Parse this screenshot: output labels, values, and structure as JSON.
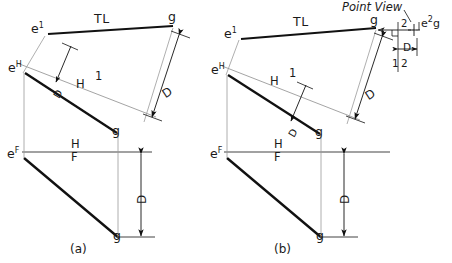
{
  "figure": {
    "title_note": "Point View",
    "captions": {
      "a": "(a)",
      "b": "(b)"
    }
  },
  "colors": {
    "object_line": "#111111",
    "construction_line": "#9a9a9a",
    "fold_line": "#444444",
    "text": "#1a1a1a",
    "background": "#ffffff"
  },
  "panel_a": {
    "caption": "(a)",
    "labels": {
      "aux_e": "e",
      "aux_e_sup": "1",
      "aux_g": "g",
      "true_length": "TL",
      "horiz_e": "e",
      "horiz_e_sup": "H",
      "horiz_g": "g",
      "front_e": "e",
      "front_e_sup": "F",
      "front_g": "g",
      "fold_h1_left": "H",
      "fold_h1_right": "1",
      "fold_hf_top": "H",
      "fold_hf_bottom": "F",
      "dim_aux": "D",
      "dim_front": "D",
      "dim_small": "D"
    }
  },
  "panel_b": {
    "caption": "(b)",
    "labels": {
      "aux_e": "e",
      "aux_e_sup": "1",
      "aux_g": "g",
      "true_length": "TL",
      "horiz_e": "e",
      "horiz_e_sup": "H",
      "horiz_g": "g",
      "front_e": "e",
      "front_e_sup": "F",
      "front_g": "g",
      "fold_h1_left": "H",
      "fold_h1_right": "1",
      "fold_hf_top": "H",
      "fold_hf_bottom": "F",
      "fold_12_left": "1",
      "fold_12_right": "2",
      "view2_label": "2",
      "point_view_note": "Point View",
      "point_view_point": "e",
      "point_view_point_sup": "2",
      "point_view_point_g": "g",
      "dim_aux": "D",
      "dim_front": "D",
      "dim_small": "D",
      "dim_pointview": "D"
    }
  }
}
